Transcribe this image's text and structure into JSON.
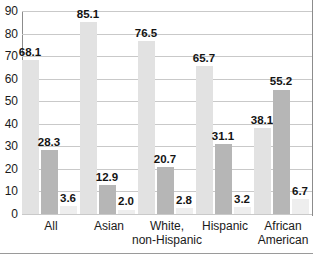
{
  "chart_data": {
    "type": "bar",
    "title": "",
    "subtitle": "",
    "xlabel": "",
    "ylabel": "",
    "ylim": [
      0,
      90
    ],
    "ytick_step": 10,
    "yticks": [
      0,
      10,
      20,
      30,
      40,
      50,
      60,
      70,
      80,
      90
    ],
    "grid": true,
    "legend": "none",
    "categories": [
      "All",
      "Asian",
      "White,\nnon-Hispanic",
      "Hispanic",
      "African\nAmerican"
    ],
    "series": [
      {
        "name": "series-1",
        "color": "#e2e2e2",
        "values": [
          68.1,
          85.1,
          76.5,
          65.7,
          38.1
        ],
        "labels": [
          "68.1",
          "85.1",
          "76.5",
          "65.7",
          "38.1"
        ]
      },
      {
        "name": "series-2",
        "color": "#b6b6b6",
        "values": [
          28.3,
          12.9,
          20.7,
          31.1,
          55.2
        ],
        "labels": [
          "28.3",
          "12.9",
          "20.7",
          "31.1",
          "55.2"
        ]
      },
      {
        "name": "series-3",
        "color": "#eeeeee",
        "values": [
          3.6,
          2.0,
          2.8,
          3.2,
          6.7
        ],
        "labels": [
          "3.6",
          "2.0",
          "2.8",
          "3.2",
          "6.7"
        ]
      }
    ]
  },
  "axis": {
    "y_labels": [
      "90",
      "80",
      "70",
      "60",
      "50",
      "40",
      "30",
      "20",
      "10",
      "0"
    ],
    "x_labels": [
      "All",
      "Asian",
      "White,\nnon-Hispanic",
      "Hispanic",
      "African\nAmerican"
    ]
  },
  "colors": {
    "series_1": "#e2e2e2",
    "series_2": "#b6b6b6",
    "series_3": "#eeeeee",
    "gridline": "#c9c9c9",
    "axis": "#8c8c8c",
    "text": "#1a1a1a"
  }
}
